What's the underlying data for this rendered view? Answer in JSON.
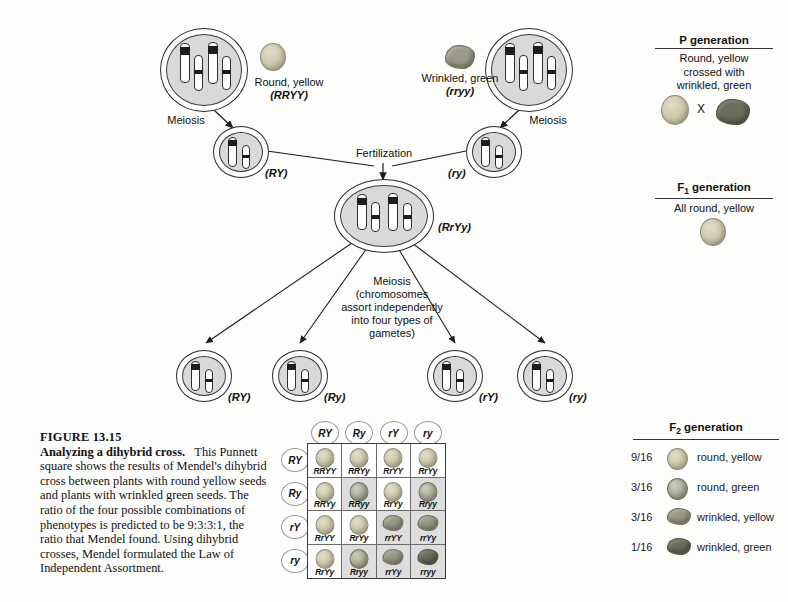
{
  "figure": {
    "number": "FIGURE 13.15",
    "title": "Analyzing a dihybrid cross.",
    "body": "This Punnett square shows the results of Mendel's dihybrid cross between plants with round yellow seeds and plants with wrinkled green seeds. The ratio of the four possible combinations of phenotypes is predicted to be 9:3:3:1, the ratio that Mendel found. Using dihybrid crosses, Mendel formulated the Law of Independent Assortment."
  },
  "diagram": {
    "parent_left": {
      "phenotype": "Round, yellow",
      "genotype": "(RRYY)",
      "meiosis": "Meiosis"
    },
    "parent_right": {
      "phenotype": "Wrinkled, green",
      "genotype": "(rryy)",
      "meiosis": "Meiosis"
    },
    "gamete_left": "(RY)",
    "gamete_right": "(ry)",
    "fertilization": "Fertilization",
    "zygote": "(RrYy)",
    "meiosis_note": "Meiosis (chromosomes assort independently into four types of gametes)",
    "meiosis_note_lines": [
      "Meiosis",
      "(chromosomes",
      "assort independently",
      "into four types of",
      "gametes)"
    ],
    "f1_gametes": [
      "(RY)",
      "(Ry)",
      "(rY)",
      "(ry)"
    ]
  },
  "panels": {
    "p": {
      "title": "P generation",
      "lines": [
        "Round, yellow",
        "crossed with",
        "wrinkled, green"
      ],
      "cross_symbol": "X"
    },
    "f1": {
      "title_prefix": "F",
      "title_sub": "1",
      "title_suffix": " generation",
      "subtitle": "All round, yellow"
    },
    "f2": {
      "title_prefix": "F",
      "title_sub": "2",
      "title_suffix": " generation",
      "rows": [
        {
          "fraction": "9/16",
          "phenotype": "round, yellow",
          "seed": "round-yellow"
        },
        {
          "fraction": "3/16",
          "phenotype": "round, green",
          "seed": "round-green"
        },
        {
          "fraction": "3/16",
          "phenotype": "wrinkled, yellow",
          "seed": "wrinkled-yellow"
        },
        {
          "fraction": "1/16",
          "phenotype": "wrinkled, green",
          "seed": "wrinkled-green"
        }
      ]
    }
  },
  "punnett": {
    "col_headers": [
      "RY",
      "Ry",
      "rY",
      "ry"
    ],
    "row_headers": [
      "RY",
      "Ry",
      "rY",
      "ry"
    ],
    "cells": [
      {
        "genotype": "RRYY",
        "seed": "round-yellow",
        "shade": false
      },
      {
        "genotype": "RRYy",
        "seed": "round-yellow",
        "shade": false
      },
      {
        "genotype": "RrYY",
        "seed": "round-yellow",
        "shade": false
      },
      {
        "genotype": "RrYy",
        "seed": "round-yellow",
        "shade": false
      },
      {
        "genotype": "RRYy",
        "seed": "round-yellow",
        "shade": false
      },
      {
        "genotype": "RRyy",
        "seed": "round-green",
        "shade": true
      },
      {
        "genotype": "RrYy",
        "seed": "round-yellow",
        "shade": false
      },
      {
        "genotype": "Rryy",
        "seed": "round-green",
        "shade": true
      },
      {
        "genotype": "RrYY",
        "seed": "round-yellow",
        "shade": false
      },
      {
        "genotype": "RrYy",
        "seed": "round-yellow",
        "shade": false
      },
      {
        "genotype": "rrYY",
        "seed": "wrinkled-yellow",
        "shade": true
      },
      {
        "genotype": "rrYy",
        "seed": "wrinkled-yellow",
        "shade": true
      },
      {
        "genotype": "RrYy",
        "seed": "round-yellow",
        "shade": false
      },
      {
        "genotype": "Rryy",
        "seed": "round-green",
        "shade": true
      },
      {
        "genotype": "rrYy",
        "seed": "wrinkled-yellow",
        "shade": true
      },
      {
        "genotype": "rryy",
        "seed": "wrinkled-green",
        "shade": true
      }
    ]
  },
  "colors": {
    "ink": "#1a1a1a",
    "cell_fill": "#d9d9d9",
    "seed_yellow": "#cfcbb0",
    "seed_green_round": "#a9ab95",
    "seed_wrinkled_yellow": "#9a9a86",
    "seed_wrinkled_green": "#6b6d58"
  }
}
